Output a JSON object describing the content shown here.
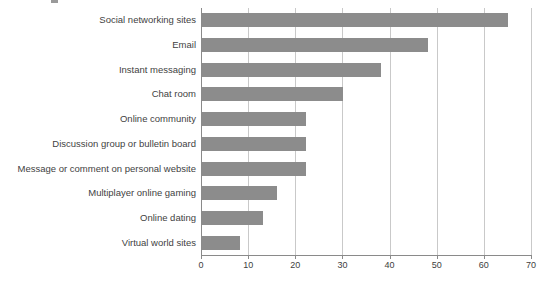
{
  "chart_data": {
    "type": "bar",
    "orientation": "horizontal",
    "title": "",
    "subtitle": "",
    "xlabel": "",
    "ylabel": "",
    "xlim": [
      0,
      70
    ],
    "ylim": null,
    "grid": "vertical",
    "legend": null,
    "bar_color": "#8c8c8c",
    "gridline_color": "#c9c9c9",
    "axis_color": "#8a8a8a",
    "xticks": [
      0,
      10,
      20,
      30,
      40,
      50,
      60,
      70
    ],
    "xtick_labels": [
      "0",
      "10",
      "20",
      "30",
      "40",
      "50",
      "60",
      "70"
    ],
    "categories": [
      "Social networking sites",
      "Email",
      "Instant messaging",
      "Chat room",
      "Online community",
      "Discussion group or bulletin board",
      "Message or comment on personal website",
      "Multiplayer online gaming",
      "Online dating",
      "Virtual world sites"
    ],
    "values": [
      65,
      48,
      38,
      30,
      22,
      22,
      22,
      16,
      13,
      8
    ]
  },
  "caption": {
    "text": ""
  }
}
